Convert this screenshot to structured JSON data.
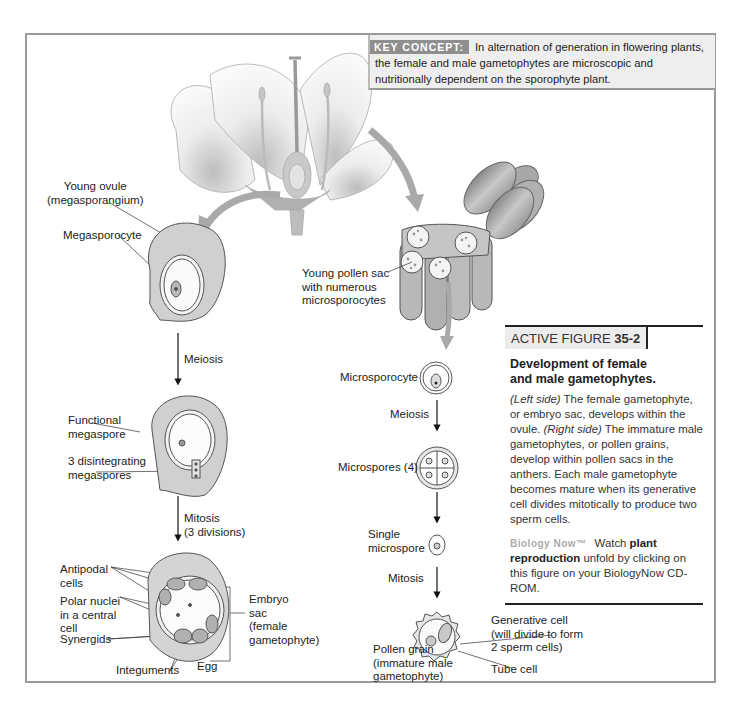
{
  "key_concept": {
    "label": "KEY CONCEPT:",
    "text": "In alternation of generation in flowering plants, the female and male gametophytes are microscopic and nutritionally dependent on the sporophyte plant."
  },
  "female_side": {
    "young_ovule": [
      "Young ovule",
      "(megasporangium)"
    ],
    "megasporocyte": "Megasporocyte",
    "meiosis": "Meiosis",
    "functional_megaspore": [
      "Functional",
      "megaspore"
    ],
    "disintegrating": [
      "3 disintegrating",
      "megaspores"
    ],
    "mitosis": [
      "Mitosis",
      "(3 divisions)"
    ],
    "antipodal": [
      "Antipodal",
      "cells"
    ],
    "polar_nuclei": [
      "Polar nuclei",
      "in a central",
      "cell"
    ],
    "synergids": "Synergids",
    "integuments": "Integuments",
    "egg": "Egg",
    "embryo_sac": [
      "Embryo",
      "sac",
      "(female",
      "gametophyte)"
    ]
  },
  "male_side": {
    "pollen_sac": [
      "Young pollen sac",
      "with numerous",
      "microsporocytes"
    ],
    "microsporocyte": "Microsporocyte",
    "meiosis": "Meiosis",
    "microspores": "Microspores (4)",
    "single_microspore": [
      "Single",
      "microspore"
    ],
    "mitosis": "Mitosis",
    "generative_cell": [
      "Generative cell",
      "(will divide to form",
      "2 sperm cells)"
    ],
    "pollen_grain": [
      "Pollen grain",
      "(immature male",
      "gametophyte)"
    ],
    "tube_cell": "Tube cell"
  },
  "active_figure": {
    "prefix": "ACTIVE FIGURE ",
    "number": "35-2",
    "title_lines": [
      "Development of female",
      "and male gametophytes."
    ],
    "left_side_label": "(Left side)",
    "left_side_text": " The female gametophyte, or embryo sac, develops within the ovule. ",
    "right_side_label": "(Right side)",
    "right_side_text": " The immature male gametophytes, or pollen grains, develop within pollen sacs in the anthers. Each male gametophyte becomes mature when its generative cell divides mitotically to produce two sperm cells.",
    "biologynow_logo": "Biology Now™",
    "watch": "Watch ",
    "watch_bold": "plant reproduction",
    "watch_rest": " unfold by clicking on this figure on your BiologyNow CD-ROM."
  },
  "colors": {
    "frame": "#9a9a9a",
    "keyconcept_bg": "#eeeeee",
    "keyconcept_label_bg": "#8f8f8f",
    "arrow_gray": "#a9a9a9",
    "tissue_gray": "#d4d4d4"
  }
}
